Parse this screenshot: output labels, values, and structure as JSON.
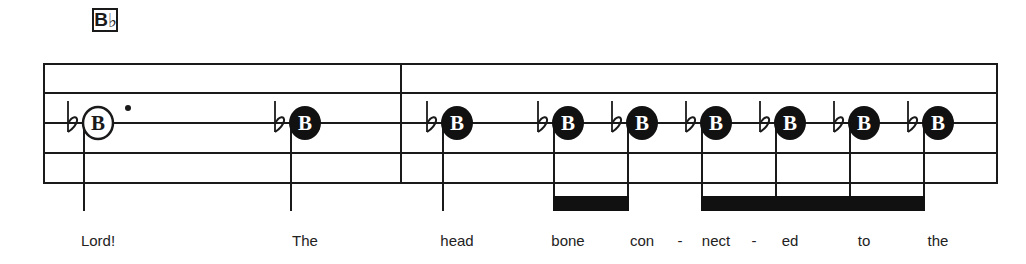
{
  "chord": {
    "root": "B",
    "accidental": "♭"
  },
  "staff": {
    "left": 44,
    "right": 997,
    "lines_y": [
      64,
      93,
      123,
      153,
      183
    ],
    "barlines_x": [
      44,
      401,
      997
    ],
    "color": "#1a1a1a"
  },
  "notes": [
    {
      "x": 98,
      "label": "B",
      "accidental": "♭",
      "filled": false,
      "dotted": true
    },
    {
      "x": 305,
      "label": "B",
      "accidental": "♭",
      "filled": true,
      "dotted": false
    },
    {
      "x": 457,
      "label": "B",
      "accidental": "♭",
      "filled": true,
      "dotted": false
    },
    {
      "x": 568,
      "label": "B",
      "accidental": "♭",
      "filled": true,
      "dotted": false
    },
    {
      "x": 642,
      "label": "B",
      "accidental": "♭",
      "filled": true,
      "dotted": false
    },
    {
      "x": 716,
      "label": "B",
      "accidental": "♭",
      "filled": true,
      "dotted": false
    },
    {
      "x": 790,
      "label": "B",
      "accidental": "♭",
      "filled": true,
      "dotted": false
    },
    {
      "x": 864,
      "label": "B",
      "accidental": "♭",
      "filled": true,
      "dotted": false
    },
    {
      "x": 938,
      "label": "B",
      "accidental": "♭",
      "filled": true,
      "dotted": false
    }
  ],
  "beams": [
    {
      "from_note": 3,
      "to_note": 4
    },
    {
      "from_note": 5,
      "to_note": 8
    }
  ],
  "lyrics": [
    {
      "text": "Lord!",
      "x": 98
    },
    {
      "text": "The",
      "x": 305
    },
    {
      "text": "head",
      "x": 457
    },
    {
      "text": "bone",
      "x": 568
    },
    {
      "text": "con",
      "x": 642
    },
    {
      "text": "-",
      "x": 680
    },
    {
      "text": "nect",
      "x": 716
    },
    {
      "text": "-",
      "x": 754
    },
    {
      "text": "ed",
      "x": 790
    },
    {
      "text": "to",
      "x": 864
    },
    {
      "text": "the",
      "x": 938
    }
  ]
}
